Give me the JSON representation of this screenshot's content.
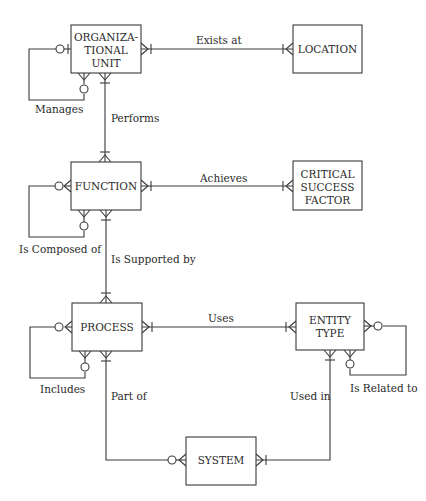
{
  "diagram": {
    "type": "entity-relationship",
    "notation": "crow's foot",
    "colors": {
      "line": "#3a3a3a",
      "text": "#2a2a2a",
      "background": "#ffffff"
    },
    "entities": [
      {
        "id": "org_unit",
        "lines": [
          "ORGANIZA-",
          "TIONAL",
          "UNIT"
        ]
      },
      {
        "id": "location",
        "lines": [
          "LOCATION"
        ]
      },
      {
        "id": "function",
        "lines": [
          "FUNCTION"
        ]
      },
      {
        "id": "csf",
        "lines": [
          "CRITICAL",
          "SUCCESS",
          "FACTOR"
        ]
      },
      {
        "id": "process",
        "lines": [
          "PROCESS"
        ]
      },
      {
        "id": "entity_type",
        "lines": [
          "ENTITY",
          "TYPE"
        ]
      },
      {
        "id": "system",
        "lines": [
          "SYSTEM"
        ]
      }
    ],
    "relationships": [
      {
        "label": "Exists at",
        "from": "org_unit",
        "to": "location",
        "from_cardinality": "many",
        "to_cardinality": "one-or-many"
      },
      {
        "label": "Manages",
        "from": "org_unit",
        "to": "org_unit",
        "from_cardinality": "zero-or-one",
        "to_cardinality": "zero-or-many"
      },
      {
        "label": "Performs",
        "from": "org_unit",
        "to": "function",
        "from_cardinality": "one-or-many",
        "to_cardinality": "one-or-many"
      },
      {
        "label": "Achieves",
        "from": "function",
        "to": "csf",
        "from_cardinality": "one-or-many",
        "to_cardinality": "one-or-many"
      },
      {
        "label": "Is Composed of",
        "from": "function",
        "to": "function",
        "from_cardinality": "zero-or-many",
        "to_cardinality": "zero-or-many"
      },
      {
        "label": "Is Supported by",
        "from": "function",
        "to": "process",
        "from_cardinality": "one-or-many",
        "to_cardinality": "one-or-many"
      },
      {
        "label": "Uses",
        "from": "process",
        "to": "entity_type",
        "from_cardinality": "one-or-many",
        "to_cardinality": "one-or-many"
      },
      {
        "label": "Includes",
        "from": "process",
        "to": "process",
        "from_cardinality": "zero-or-many",
        "to_cardinality": "zero-or-many"
      },
      {
        "label": "Is Related to",
        "from": "entity_type",
        "to": "entity_type",
        "from_cardinality": "zero-or-many",
        "to_cardinality": "zero-or-many"
      },
      {
        "label": "Part of",
        "from": "process",
        "to": "system",
        "from_cardinality": "one-or-many",
        "to_cardinality": "zero-or-many"
      },
      {
        "label": "Used in",
        "from": "entity_type",
        "to": "system",
        "from_cardinality": "one-or-many",
        "to_cardinality": "one-or-many"
      }
    ]
  },
  "labels": {
    "org_unit_1": "ORGANIZA-",
    "org_unit_2": "TIONAL",
    "org_unit_3": "UNIT",
    "location": "LOCATION",
    "function": "FUNCTION",
    "csf_1": "CRITICAL",
    "csf_2": "SUCCESS",
    "csf_3": "FACTOR",
    "process": "PROCESS",
    "entity_type_1": "ENTITY",
    "entity_type_2": "TYPE",
    "system": "SYSTEM",
    "exists_at": "Exists at",
    "manages": "Manages",
    "performs": "Performs",
    "achieves": "Achieves",
    "is_composed_of": "Is Composed of",
    "is_supported_by": "Is Supported by",
    "uses": "Uses",
    "includes": "Includes",
    "is_related_to": "Is Related to",
    "part_of": "Part of",
    "used_in": "Used in"
  }
}
